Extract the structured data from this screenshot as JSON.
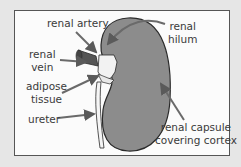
{
  "diagram": {
    "colors": {
      "kidney_fill": "#8c8c8c",
      "outline": "#2a2a2a",
      "arrow": "#6a6a6a",
      "frame_bg": "#fbfbfb",
      "page_bg": "#e6e6e6"
    },
    "labels": {
      "renal_artery": "renal artery",
      "renal_hilum_line1": "renal",
      "renal_hilum_line2": "hilum",
      "renal_vein_line1": "renal",
      "renal_vein_line2": "vein",
      "adipose_line1": "adipose",
      "adipose_line2": "tissue",
      "ureter": "ureter",
      "capsule_line1": "renal capsule",
      "capsule_line2": "covering cortex"
    }
  }
}
